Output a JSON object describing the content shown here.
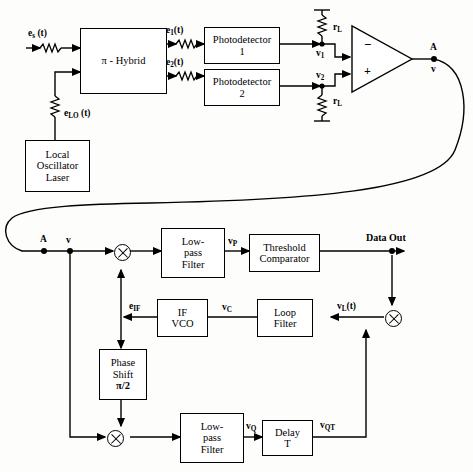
{
  "figure": {
    "type": "block-diagram"
  },
  "front_end": {
    "input_signal_label": "e",
    "input_signal_sub": "s",
    "input_signal_arg": " (t)",
    "hybrid_label": "π - Hybrid",
    "lo_label": "e",
    "lo_sub": "LO",
    "lo_arg": " (t)",
    "lo_block": "Local\nOscillator\nLaser",
    "lo_line1": "Local",
    "lo_line2": "Oscillator",
    "lo_line3": "Laser",
    "hybrid_out1": "e",
    "hybrid_out1_sub": "1",
    "hybrid_out1_arg": "(t)",
    "hybrid_out2": "e",
    "hybrid_out2_sub": "2",
    "hybrid_out2_arg": "(t)",
    "photodetector1_line1": "Photodetector",
    "photodetector1_line2": "1",
    "photodetector2_line1": "Photodetector",
    "photodetector2_line2": "2",
    "load_resistor_top": "r",
    "load_resistor_top_sub": "L",
    "load_resistor_bottom": "r",
    "load_resistor_bottom_sub": "L",
    "node_v1": "v",
    "node_v1_sub": "1",
    "node_v2": "v",
    "node_v2_sub": "2",
    "amp_minus": "−",
    "amp_plus": "+",
    "node_a_top": "A",
    "node_a_top_signal": "v"
  },
  "back_end": {
    "node_a": "A",
    "node_a_signal": "v",
    "mixer_i": "mixer-symbol",
    "mixer_q": "mixer-symbol",
    "mixer_loop": "mixer-symbol",
    "lpf_i_line1": "Low-",
    "lpf_i_line2": "pass",
    "lpf_i_line3": "Filter",
    "vp_label": "v",
    "vp_sub": "P",
    "comparator_line1": "Threshold",
    "comparator_line2": "Comparator",
    "data_out": "Data Out",
    "vl_label": "v",
    "vl_sub": "L",
    "vl_arg": "(t)",
    "loop_filter_line1": "Loop",
    "loop_filter_line2": "Filter",
    "vc_label": "v",
    "vc_sub": "C",
    "vco_line1": "IF",
    "vco_line2": "VCO",
    "eif_label": "e",
    "eif_sub": "IF",
    "phase_shift_line1": "Phase",
    "phase_shift_line2": "Shift",
    "phase_shift_line3": "π/2",
    "lpf_q_line1": "Low-",
    "lpf_q_line2": "pass",
    "lpf_q_line3": "Filter",
    "vq_label": "v",
    "vq_sub": "Q",
    "delay_line1": "Delay",
    "delay_line2": "T",
    "vqt_label": "v",
    "vqt_sub": "QT"
  },
  "colors": {
    "line": "#000000",
    "background": "#fdfdfc"
  }
}
